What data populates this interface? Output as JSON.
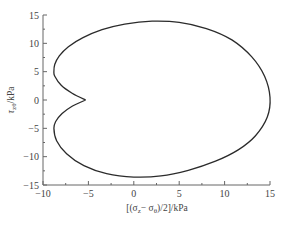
{
  "chart_data": {
    "type": "line",
    "title": "",
    "xlabel": "[(σz − σθ)/2]/kPa",
    "ylabel": "τzθ/kPa",
    "xlim": [
      -10,
      15
    ],
    "ylim": [
      -15,
      15
    ],
    "x_ticks": [
      -10,
      -5,
      0,
      5,
      10,
      15
    ],
    "y_ticks": [
      -15,
      -10,
      -5,
      0,
      5,
      10,
      15
    ],
    "grid": false,
    "legend": null,
    "series": [
      {
        "name": "stress path",
        "closed": true,
        "points": [
          [
            -5.3,
            0.0
          ],
          [
            -6.8,
            1.2
          ],
          [
            -8.0,
            2.6
          ],
          [
            -8.7,
            4.2
          ],
          [
            -8.8,
            5.0
          ],
          [
            -8.7,
            6.3
          ],
          [
            -8.2,
            7.8
          ],
          [
            -7.2,
            9.4
          ],
          [
            -5.6,
            11.0
          ],
          [
            -3.5,
            12.4
          ],
          [
            -1.0,
            13.4
          ],
          [
            2.0,
            13.9
          ],
          [
            5.0,
            13.7
          ],
          [
            8.0,
            12.6
          ],
          [
            10.8,
            10.6
          ],
          [
            13.0,
            7.6
          ],
          [
            14.4,
            4.2
          ],
          [
            15.0,
            0.5
          ],
          [
            14.7,
            -3.0
          ],
          [
            13.4,
            -6.3
          ],
          [
            11.5,
            -8.8
          ],
          [
            9.0,
            -10.8
          ],
          [
            6.0,
            -12.4
          ],
          [
            3.0,
            -13.4
          ],
          [
            0.0,
            -13.6
          ],
          [
            -3.0,
            -13.0
          ],
          [
            -5.5,
            -11.6
          ],
          [
            -7.4,
            -9.5
          ],
          [
            -8.5,
            -7.2
          ],
          [
            -8.8,
            -5.0
          ],
          [
            -8.6,
            -3.8
          ],
          [
            -7.9,
            -2.4
          ],
          [
            -6.8,
            -1.1
          ],
          [
            -5.3,
            0.0
          ]
        ]
      }
    ]
  },
  "axes": {
    "x_tick_labels": [
      "−10",
      "−5",
      "0",
      "5",
      "10",
      "15"
    ],
    "y_tick_labels": [
      "15",
      "10",
      "5",
      "0",
      "−5",
      "−10",
      "−15"
    ],
    "xlabel_main": "[(σ",
    "xlabel_sub1": "z",
    "xlabel_mid": "− σ",
    "xlabel_sub2": "θ",
    "xlabel_end": ")/2]/kPa",
    "ylabel_main": "τ",
    "ylabel_sub": "zθ",
    "ylabel_end": "/kPa"
  },
  "style": {
    "line_color": "#2b2b2b",
    "axis_color": "#666666"
  }
}
